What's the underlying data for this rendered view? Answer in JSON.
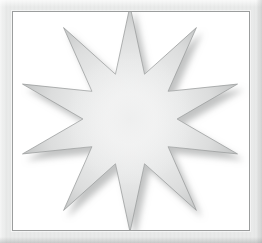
{
  "document": {
    "title": "Star Burst Graphic",
    "canvas_width": 262,
    "canvas_height": 243,
    "background_color": "#ffffff"
  },
  "frame": {
    "name": "picture-frame",
    "style": "light gray brushed bevel with thin dark inner rule",
    "face_color": "#e6e7e7",
    "highlight_color": "#f4f5f5",
    "shadow_color": "#b9bbbb",
    "inner_rule_color": "#9b9d9d",
    "border_width_px": 12,
    "mat_color": "#ffffff"
  },
  "artwork": {
    "name": "ten-point-star-burst",
    "shape": "star",
    "points": 10,
    "center_x": 130,
    "center_y": 119,
    "outer_radius": 113,
    "inner_radius": 47,
    "rotation_deg": -90,
    "fill_type": "radial-gradient",
    "fill_center_color": "#fcfcfc",
    "fill_mid_color": "#e9eaea",
    "fill_edge_color": "#a9abab",
    "outline_color": "#9c9e9e",
    "shadow_color": "#6f7171",
    "shadow_offset_x": 5,
    "shadow_offset_y": 6,
    "shadow_blur": 6,
    "tips": [
      {
        "label": "top",
        "x": 130,
        "y": 11
      },
      {
        "label": "upper-right",
        "x": 200,
        "y": 33
      },
      {
        "label": "right-upper",
        "x": 243,
        "y": 84
      },
      {
        "label": "right-lower",
        "x": 243,
        "y": 152
      },
      {
        "label": "lower-right",
        "x": 200,
        "y": 205
      },
      {
        "label": "bottom",
        "x": 136,
        "y": 226
      },
      {
        "label": "lower-left",
        "x": 62,
        "y": 208
      },
      {
        "label": "left-lower",
        "x": 18,
        "y": 155
      },
      {
        "label": "left-upper",
        "x": 18,
        "y": 88
      },
      {
        "label": "upper-left",
        "x": 58,
        "y": 30
      }
    ]
  }
}
